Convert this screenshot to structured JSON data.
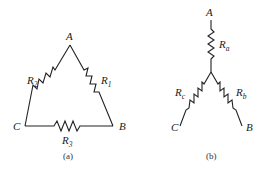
{
  "diagram_a": {
    "caption": "(a)",
    "nodes": {
      "A": "A",
      "B": "B",
      "C": "C"
    },
    "resistors": {
      "R1": {
        "main": "R",
        "sub": "1"
      },
      "R2": {
        "main": "R",
        "sub": "2"
      },
      "R3": {
        "main": "R",
        "sub": "3"
      }
    }
  },
  "diagram_b": {
    "caption": "(b)",
    "nodes": {
      "A": "A",
      "B": "B",
      "C": "C"
    },
    "resistors": {
      "Ra": {
        "main": "R",
        "sub": "a"
      },
      "Rb": {
        "main": "R",
        "sub": "b"
      },
      "Rc": {
        "main": "R",
        "sub": "c"
      }
    }
  }
}
